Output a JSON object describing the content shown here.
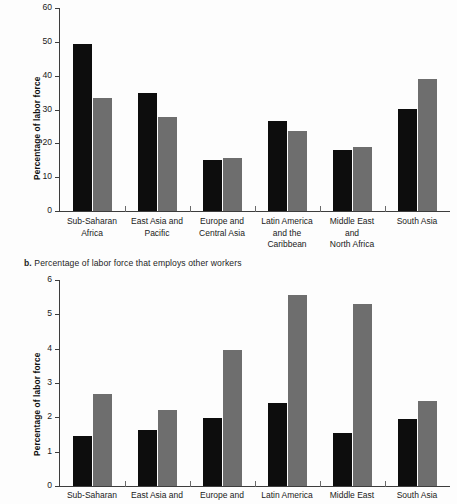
{
  "chart_data": [
    {
      "id": "panel-a",
      "type": "bar",
      "title": "",
      "panel_letter": "",
      "xlabel": "",
      "ylabel": "Percentage of labor force",
      "ylim": [
        0,
        60
      ],
      "yticks": [
        0,
        10,
        20,
        30,
        40,
        50,
        60
      ],
      "grid": false,
      "legend": "none",
      "categories": [
        "Sub-Saharan\nAfrica",
        "East Asia and\nPacific",
        "Europe and\nCentral Asia",
        "Latin America\nand the\nCaribbean",
        "Middle East\nand\nNorth Africa",
        "South Asia"
      ],
      "series": [
        {
          "name": "series-1",
          "color": "#0d0d0d",
          "values": [
            49.4,
            34.9,
            15.2,
            26.5,
            17.9,
            30.1
          ]
        },
        {
          "name": "series-2",
          "color": "#6e6e6e",
          "values": [
            33.5,
            27.8,
            15.8,
            23.5,
            19.0,
            39.0
          ]
        }
      ]
    },
    {
      "id": "panel-b",
      "type": "bar",
      "title": "Percentage of labor force that employs other workers",
      "panel_letter": "b.",
      "xlabel": "",
      "ylabel": "Percentage of labor force",
      "ylim": [
        0,
        6
      ],
      "yticks": [
        0,
        1,
        2,
        3,
        4,
        5,
        6
      ],
      "grid": false,
      "legend": "none",
      "categories": [
        "Sub-Saharan",
        "East Asia and",
        "Europe and",
        "Latin America",
        "Middle East",
        "South Asia"
      ],
      "series": [
        {
          "name": "series-1",
          "color": "#0d0d0d",
          "values": [
            1.47,
            1.63,
            1.98,
            2.42,
            1.55,
            1.95
          ]
        },
        {
          "name": "series-2",
          "color": "#6e6e6e",
          "values": [
            2.69,
            2.22,
            3.95,
            5.57,
            5.31,
            2.47
          ]
        }
      ]
    }
  ],
  "colors": {
    "series_1": "#0d0d0d",
    "series_2": "#6e6e6e",
    "axis": "#3d3d3d",
    "background": "#fdfdfd",
    "text": "#1a1a1a"
  }
}
